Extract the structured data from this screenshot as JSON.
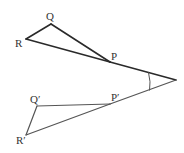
{
  "diagram": {
    "colors": {
      "stroke": "#2a2a2a",
      "stroke_light": "#555555",
      "label": "#333333",
      "background": "#ffffff"
    },
    "points": {
      "Q": {
        "label": "Q",
        "x": 51,
        "y": 24
      },
      "R": {
        "label": "R",
        "x": 26,
        "y": 39
      },
      "P": {
        "label": "P",
        "x": 110,
        "y": 62
      },
      "O": {
        "label": "",
        "x": 176,
        "y": 80
      },
      "Qp": {
        "label": "Q′",
        "x": 37,
        "y": 106
      },
      "Pp": {
        "label": "P′",
        "x": 110,
        "y": 104
      },
      "Rp": {
        "label": "R′",
        "x": 26,
        "y": 135
      }
    },
    "labels": {
      "Q": "Q",
      "R": "R",
      "P": "P",
      "Qp": "Q′",
      "Pp": "P′",
      "Rp": "R′"
    },
    "angle_arc": {
      "center": "O",
      "meaning": "rotation angle"
    }
  }
}
